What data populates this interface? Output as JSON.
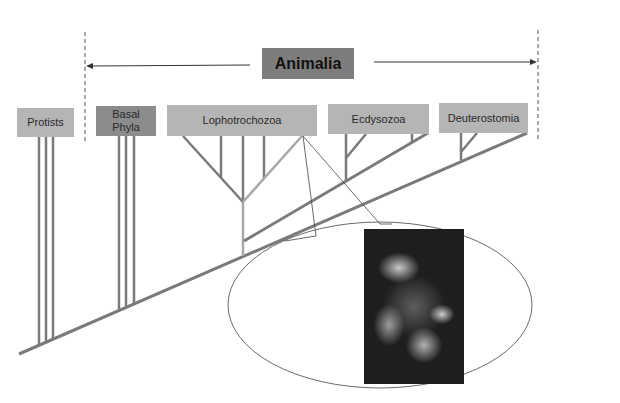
{
  "diagram": {
    "title": "Animalia",
    "groups": [
      {
        "id": "protists",
        "label": "Protists"
      },
      {
        "id": "basal-phyla",
        "label": "Basal Phyla"
      },
      {
        "id": "lophotrochozoa",
        "label": "Lophotrochozoa"
      },
      {
        "id": "ecdysozoa",
        "label": "Ecdysozoa"
      },
      {
        "id": "deuterostomia",
        "label": "Deuterostomia"
      }
    ],
    "labels": {
      "protists": "Protists",
      "basal_line1": "Basal",
      "basal_line2": "Phyla",
      "lophotrochozoa": "Lophotrochozoa",
      "ecdysozoa": "Ecdysozoa",
      "deuterostomia": "Deuterostomia"
    },
    "callout": {
      "source_group": "Lophotrochozoa",
      "image_subject": "feather-duster / Christmas tree worm photograph"
    },
    "colors": {
      "branch": "#7a7a7a",
      "branch_light": "#a8a8a8",
      "box_light": "#b5b5b5",
      "box_dark": "#8c8c8c",
      "title_box": "#7d7d7d",
      "dashed_line": "#555555"
    }
  }
}
